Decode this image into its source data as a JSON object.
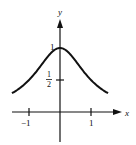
{
  "chart_data": {
    "type": "line",
    "title": "",
    "xlabel": "x",
    "ylabel": "y",
    "function": "y = 1/(1+x^2)",
    "x": [
      -1.55,
      -1.25,
      -1,
      -0.75,
      -0.5,
      -0.25,
      0,
      0.25,
      0.5,
      0.75,
      1,
      1.25,
      1.55
    ],
    "series": [
      {
        "name": "curve",
        "values": [
          0.29,
          0.39,
          0.5,
          0.64,
          0.8,
          0.94,
          1.0,
          0.94,
          0.8,
          0.64,
          0.5,
          0.39,
          0.29
        ]
      }
    ],
    "x_ticks": [
      {
        "value": -1,
        "label": "−1"
      },
      {
        "value": 1,
        "label": "1"
      }
    ],
    "y_ticks": [
      {
        "value": 0.5,
        "label_num": "1",
        "label_den": "2"
      },
      {
        "value": 1,
        "label": "1"
      }
    ],
    "xlim": [
      -1.6,
      1.9
    ],
    "ylim": [
      -0.45,
      1.45
    ],
    "grid": false,
    "legend": null
  },
  "labels": {
    "x_axis": "x",
    "y_axis": "y",
    "tick_x_neg1": "−1",
    "tick_x_pos1": "1",
    "tick_y_1": "1",
    "tick_y_half_num": "1",
    "tick_y_half_den": "2"
  }
}
